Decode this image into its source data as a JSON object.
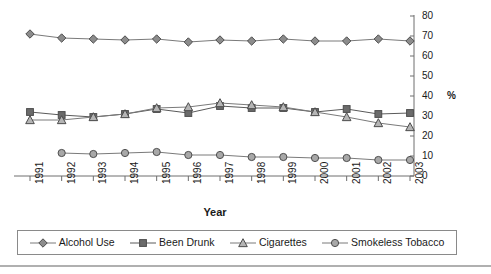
{
  "chart_data": {
    "type": "line",
    "title": "",
    "xlabel": "Year",
    "ylabel": "%",
    "ylim": [
      0,
      80
    ],
    "ytick_step": 10,
    "yticks": [
      0,
      10,
      20,
      30,
      40,
      50,
      60,
      70,
      80
    ],
    "grid": false,
    "y_axis_position": "right",
    "legend_position": "bottom",
    "categories": [
      "1991",
      "1992",
      "1993",
      "1994",
      "1995",
      "1996",
      "1997",
      "1998",
      "1999",
      "2000",
      "2001",
      "2002",
      "2003"
    ],
    "series": [
      {
        "name": "Alcohol Use",
        "marker": "diamond",
        "color": "#8c8c8c",
        "line_color": "#7a7a7a",
        "values": [
          71,
          69,
          68.5,
          68,
          68.5,
          67,
          68,
          67.5,
          68.5,
          67.5,
          67.5,
          68.5,
          67.5
        ]
      },
      {
        "name": "Been Drunk",
        "marker": "square",
        "color": "#6b6b6b",
        "line_color": "#5a5a5a",
        "values": [
          32,
          30.5,
          29.5,
          31,
          33.5,
          31.5,
          35,
          34,
          34,
          32,
          33.5,
          31,
          31.5
        ]
      },
      {
        "name": "Cigarettes",
        "marker": "triangle",
        "color": "#b5b5b5",
        "line_color": "#7a7a7a",
        "values": [
          28,
          28,
          29.5,
          31,
          34,
          34.5,
          36.5,
          35.5,
          34.5,
          32,
          29.5,
          26.5,
          24.5
        ]
      },
      {
        "name": "Smokeless Tobacco",
        "marker": "circle",
        "color": "#a8a8a8",
        "line_color": "#7a7a7a",
        "values": [
          null,
          11.5,
          11,
          11.5,
          12,
          10.5,
          10.5,
          9.5,
          9.5,
          9,
          9,
          8,
          8
        ]
      }
    ]
  },
  "axis": {
    "x_title": "Year",
    "y_unit_label": "%",
    "ytick_labels": [
      "0",
      "10",
      "20",
      "30",
      "40",
      "50",
      "60",
      "70",
      "80"
    ],
    "xtick_labels": [
      "1991",
      "1992",
      "1993",
      "1994",
      "1995",
      "1996",
      "1997",
      "1998",
      "1999",
      "2000",
      "2001",
      "2002",
      "2003"
    ]
  },
  "legend": {
    "items": [
      {
        "label": "Alcohol Use",
        "marker": "diamond"
      },
      {
        "label": "Been Drunk",
        "marker": "square"
      },
      {
        "label": "Cigarettes",
        "marker": "triangle"
      },
      {
        "label": "Smokeless Tobacco",
        "marker": "circle"
      }
    ]
  },
  "colors": {
    "axis": "#6e6e6e",
    "text": "#1a1a1a",
    "legend_border": "#8a8a8a",
    "rule": "#b0b0b0"
  }
}
